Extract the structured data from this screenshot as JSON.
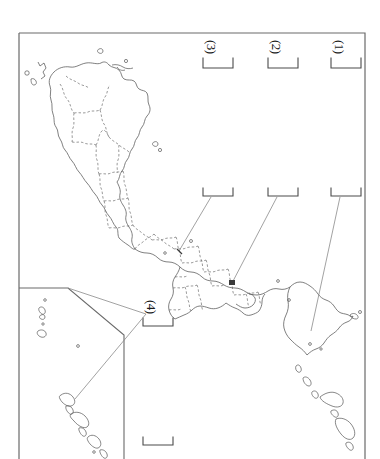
{
  "document": {
    "kind": "blank-map-worksheet",
    "region_title": "Japan",
    "page_background": "#ffffff",
    "ink_color": "#404040",
    "map_outline_color": "#555555",
    "prefecture_border_style": "dashed"
  },
  "frame": {
    "outer_border": {
      "x": 19,
      "y": 33,
      "width": 346,
      "height": 430,
      "visible_sides": "left-top-right, bottom cropped"
    },
    "inset_box": {
      "name": "nansei-islands-inset",
      "description": "Lower-left inset panel containing the Nansei (Ryukyu) island chain",
      "top_edge_y": 288,
      "right_edge_x": 124,
      "diagonal_corner": true
    }
  },
  "answer_blanks": [
    {
      "id": "blank-1",
      "number_label": "(1)",
      "label_x": 331,
      "label_y": 40,
      "top_bracket": {
        "x": 331,
        "y": 62,
        "width": 30
      },
      "lower_bracket": {
        "x": 331,
        "y": 192,
        "width": 30
      },
      "leader_line": {
        "x1": 339,
        "y1": 196,
        "x2": 312,
        "y2": 330
      },
      "answer_value": ""
    },
    {
      "id": "blank-2",
      "number_label": "(2)",
      "label_x": 271,
      "label_y": 40,
      "top_bracket": {
        "x": 268,
        "y": 62,
        "width": 30
      },
      "lower_bracket": {
        "x": 268,
        "y": 192,
        "width": 30
      },
      "leader_line": {
        "x1": 276,
        "y1": 196,
        "x2": 232,
        "y2": 283
      },
      "answer_value": ""
    },
    {
      "id": "blank-3",
      "number_label": "(3)",
      "label_x": 211,
      "label_y": 40,
      "top_bracket": {
        "x": 203,
        "y": 62,
        "width": 30
      },
      "lower_bracket": {
        "x": 203,
        "y": 192,
        "width": 30
      },
      "leader_line": {
        "x1": 211,
        "y1": 196,
        "x2": 180,
        "y2": 252
      },
      "answer_value": ""
    },
    {
      "id": "blank-4",
      "number_label": "(4)",
      "label_x": 150,
      "label_y": 300,
      "top_bracket": {
        "x": 143,
        "y": 322,
        "width": 30
      },
      "lower_bracket": {
        "x": 143,
        "y": 441,
        "width": 30
      },
      "leader_line": {
        "x1": 146,
        "y1": 316,
        "x2": 76,
        "y2": 400
      },
      "answer_value": ""
    }
  ],
  "map_markers": [
    {
      "id": "marker-a",
      "x": 232,
      "y": 283,
      "shape": "filled-square",
      "belongs_to": "blank-2"
    },
    {
      "id": "marker-b",
      "x": 180,
      "y": 252,
      "shape": "tick",
      "belongs_to": "blank-3"
    }
  ],
  "legend": {
    "note": ""
  }
}
